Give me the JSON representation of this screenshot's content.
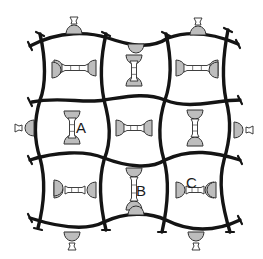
{
  "figure": {
    "type": "schematic-grid",
    "rows": 3,
    "cols": 3,
    "labels": [
      {
        "id": "A",
        "text": "A"
      },
      {
        "id": "B",
        "text": "B"
      },
      {
        "id": "C",
        "text": "C"
      }
    ],
    "colors": {
      "line": "#141414",
      "background": "#ffffff"
    }
  }
}
